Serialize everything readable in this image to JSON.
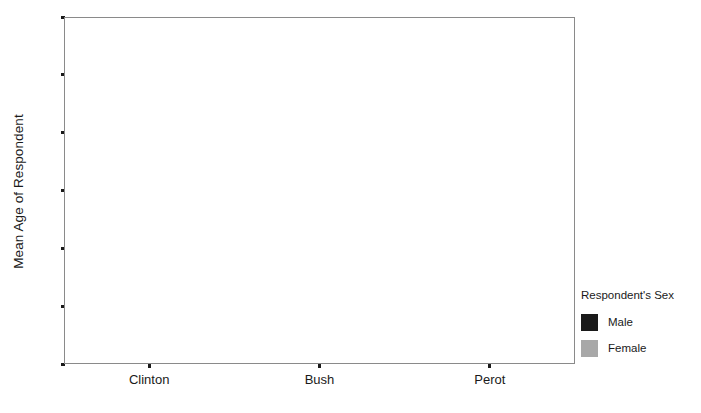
{
  "chart_data": {
    "type": "bar",
    "title": "",
    "subtitle": "",
    "xlabel": "",
    "ylabel": "Mean Age of Respondent",
    "categories": [
      "Clinton",
      "Bush",
      "Perot"
    ],
    "series": [
      {
        "name": "Male",
        "color": "#1a1a1a",
        "values": [
          null,
          null,
          null
        ]
      },
      {
        "name": "Female",
        "color": "#a8a8a8",
        "values": [
          null,
          null,
          null
        ]
      }
    ],
    "ylim": [
      40,
      52
    ],
    "ytick_labels": [
      "40",
      "42",
      "44",
      "46",
      "48",
      "50",
      "52"
    ],
    "ytick_values": [
      40,
      42,
      44,
      46,
      48,
      50,
      52
    ],
    "xtick_labels": [
      "Clinton",
      "Bush",
      "Perot"
    ],
    "grid": false,
    "legend": {
      "title": "Respondent's Sex",
      "position": "right",
      "entries": [
        {
          "label": "Male",
          "color": "#1a1a1a"
        },
        {
          "label": "Female",
          "color": "#a8a8a8"
        }
      ]
    }
  }
}
